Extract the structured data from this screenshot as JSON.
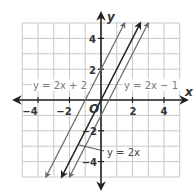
{
  "chart_data": {
    "type": "line",
    "title": "",
    "xlabel": "x",
    "ylabel": "y",
    "xlim": [
      -5,
      5
    ],
    "ylim": [
      -5,
      5
    ],
    "grid": true,
    "origin_label": "O",
    "x_ticks": [
      -4,
      -2,
      2,
      4
    ],
    "y_ticks": [
      4,
      2,
      -2,
      -4
    ],
    "x_tick_labels": [
      "−4",
      "−2",
      "2",
      "4"
    ],
    "y_tick_labels": [
      "4",
      "2",
      "−2",
      "−4"
    ],
    "series": [
      {
        "name": "y = 2x + 2",
        "slope": 2,
        "intercept": 2,
        "x": [
          -3.5,
          1.5
        ],
        "y": [
          -5,
          5
        ],
        "color": "#6e6e6e",
        "label_pos": "upper-left"
      },
      {
        "name": "y = 2x",
        "slope": 2,
        "intercept": 0,
        "x": [
          -2.5,
          2.5
        ],
        "y": [
          -5,
          5
        ],
        "color": "#222222",
        "label_pos": "lower-right-leader"
      },
      {
        "name": "y = 2x − 1",
        "slope": 2,
        "intercept": -1,
        "x": [
          -2,
          3
        ],
        "y": [
          -5,
          5
        ],
        "color": "#6e6e6e",
        "label_pos": "upper-right"
      }
    ],
    "legend": "inline labels"
  },
  "labels": {
    "x_axis": "x",
    "y_axis": "y",
    "origin": "O",
    "eq1": "y = 2x + 2",
    "eq2": "y = 2x − 1",
    "eq3": "y = 2x",
    "xt_m4": "−4",
    "xt_m2": "−2",
    "xt_2": "2",
    "xt_4": "4",
    "yt_4": "4",
    "yt_2": "2",
    "yt_m2": "−2",
    "yt_m4": "−4"
  },
  "colors": {
    "grid": "#c8c8c8",
    "axis": "#222222",
    "line_gray": "#6e6e6e",
    "line_dark": "#222222",
    "label_gray": "#7a7a7a",
    "label_dark": "#444444",
    "background": "#ffffff"
  }
}
